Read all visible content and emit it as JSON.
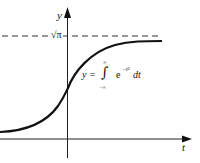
{
  "figure": {
    "axes": {
      "x_label": "t",
      "y_label": "y",
      "asymptote_label": "√π"
    },
    "formula": {
      "lhs": "y =",
      "integral_sign": "∫",
      "upper_limit": "∞",
      "lower_limit": "−∞",
      "integrand": "e",
      "exponent": "−t²",
      "differential": "dt"
    },
    "colors": {
      "line": "#111111",
      "axis": "#222222",
      "dashed": "#333333"
    }
  }
}
